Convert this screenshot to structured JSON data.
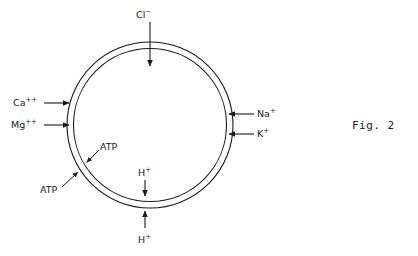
{
  "figure": {
    "caption": "Fig. 2",
    "caption_x": 352,
    "caption_y": 119
  },
  "membrane": {
    "center_x": 150,
    "center_y": 125,
    "outer_radius": 83,
    "inner_radius": 76.5,
    "stroke_color": "#1a1a1a",
    "stroke_width": 1.1,
    "fill": "none"
  },
  "transport_labels": {
    "chloride": "Cl",
    "chloride_charge": "−",
    "calcium": "Ca",
    "calcium_charge": "++",
    "magnesium": "Mg",
    "magnesium_charge": "++",
    "sodium": "Na",
    "sodium_charge": "+",
    "potassium": "K",
    "potassium_charge": "+",
    "proton_inner": "H",
    "proton_inner_charge": "+",
    "proton_outer": "H",
    "proton_outer_charge": "+",
    "atp_upper": "ATP",
    "atp_lower": "ATP"
  },
  "arrows": {
    "chloride": {
      "direction": "down-into-cell",
      "from_x": 150,
      "from_y": 22,
      "to_x": 150,
      "to_y": 66
    },
    "calcium": {
      "direction": "right-into-cell",
      "from_x": 44,
      "from_y": 103,
      "to_x": 69,
      "to_y": 103
    },
    "magnesium": {
      "direction": "right-into-cell",
      "from_x": 44,
      "from_y": 125,
      "to_x": 69,
      "to_y": 125
    },
    "sodium": {
      "direction": "left-into-cell",
      "from_x": 254,
      "from_y": 114,
      "to_x": 229,
      "to_y": 114
    },
    "potassium": {
      "direction": "left-into-cell",
      "from_x": 254,
      "from_y": 134,
      "to_x": 229,
      "to_y": 134
    },
    "proton_inner": {
      "direction": "down-toward-membrane",
      "from_x": 145,
      "from_y": 180,
      "to_x": 145,
      "to_y": 196
    },
    "proton_outer": {
      "direction": "up-toward-membrane",
      "from_x": 145,
      "from_y": 228,
      "to_x": 145,
      "to_y": 211
    },
    "atp_upper": {
      "direction": "down-left-to-membrane",
      "from_x": 98,
      "from_y": 151,
      "to_x": 86,
      "to_y": 163
    },
    "atp_lower": {
      "direction": "up-right-to-membrane",
      "from_x": 63,
      "from_y": 186,
      "to_x": 78,
      "to_y": 173
    }
  },
  "colors": {
    "background": "#ffffff",
    "ink": "#1a1a1a"
  }
}
